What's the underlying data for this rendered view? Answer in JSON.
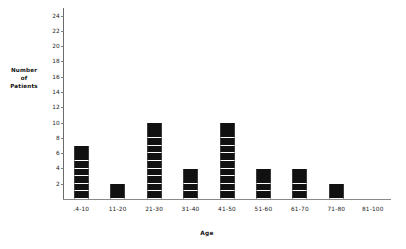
{
  "chart_data": {
    "type": "bar",
    "title": "",
    "xlabel": "Age",
    "ylabel": "Number of Patients",
    "ylabel_lines": [
      "Number",
      "of",
      "Patients"
    ],
    "categories": [
      ".4-10",
      "11-20",
      "21-30",
      "31-40",
      "41-50",
      "51-60",
      "61-70",
      "71-80",
      "81-100"
    ],
    "values": [
      7,
      2,
      10,
      4,
      10,
      4,
      4,
      2,
      0
    ],
    "yticks": [
      2,
      4,
      6,
      8,
      10,
      12,
      14,
      16,
      18,
      20,
      22,
      24
    ],
    "ylim": [
      0,
      25
    ],
    "grid": false,
    "legend": false,
    "bar_style": "stacked-unit-blocks",
    "bar_color": "#111111",
    "axis_color": "#7c7c7c"
  }
}
